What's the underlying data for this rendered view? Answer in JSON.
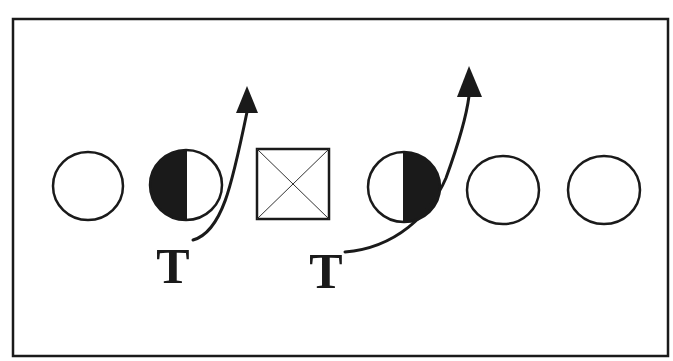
{
  "diagram": {
    "type": "football-play-diagram",
    "colors": {
      "stroke": "#1a1a1a",
      "fill": "#1a1a1a",
      "background": "#ffffff"
    },
    "border": {
      "x": 13,
      "y": 19,
      "width": 655,
      "height": 337
    },
    "center": {
      "shape": "square-with-x",
      "x": 257,
      "y": 149,
      "width": 72,
      "height": 70
    },
    "linemen": [
      {
        "id": "lineman-1",
        "cx": 88,
        "cy": 186,
        "rx": 35,
        "ry": 34,
        "fill": "none"
      },
      {
        "id": "lineman-2",
        "cx": 186,
        "cy": 185,
        "rx": 36,
        "ry": 35,
        "fill": "left-half"
      },
      {
        "id": "lineman-4",
        "cx": 404,
        "cy": 187,
        "rx": 36,
        "ry": 35,
        "fill": "right-half"
      },
      {
        "id": "lineman-5",
        "cx": 503,
        "cy": 190,
        "rx": 36,
        "ry": 34,
        "fill": "none"
      },
      {
        "id": "lineman-6",
        "cx": 604,
        "cy": 190,
        "rx": 36,
        "ry": 34,
        "fill": "none"
      }
    ],
    "defenders": [
      {
        "label": "T",
        "x": 173,
        "y": 283
      },
      {
        "label": "T",
        "x": 326,
        "y": 288
      }
    ],
    "routes": [
      {
        "id": "route-left-tackle",
        "path": "M 193 240 C 222 232, 232 185, 247 112",
        "arrow": "247,86 236,113 258,113"
      },
      {
        "id": "route-right-tackle",
        "path": "M 345 252 C 395 248, 430 215, 446 178 C 458 145, 466 120, 469 96",
        "arrow": "469,66 457,97 482,97"
      }
    ]
  }
}
